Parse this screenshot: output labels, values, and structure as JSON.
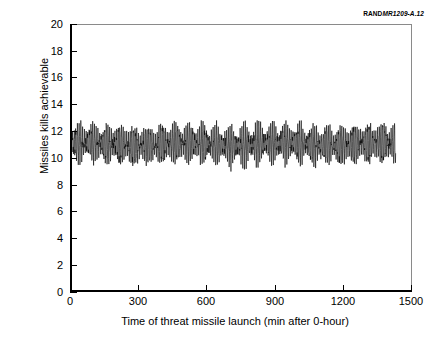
{
  "figure": {
    "corner_id_brand": "RAND",
    "corner_id_doc": "MR1209-A.12"
  },
  "chart_data": {
    "type": "line",
    "title": "",
    "xlabel": "Time of threat missile launch (min after 0-hour)",
    "ylabel": "Missiles kills achievable",
    "xlim": [
      0,
      1500
    ],
    "ylim": [
      0,
      20
    ],
    "xticks": [
      0,
      300,
      600,
      900,
      1200,
      1500
    ],
    "yticks": [
      0,
      2,
      4,
      6,
      8,
      10,
      12,
      14,
      16,
      18,
      20
    ],
    "grid": false,
    "legend": null,
    "series": [
      {
        "name": "Missile kills achievable",
        "color": "#000000",
        "x_start": 0,
        "x_end": 1432,
        "n_points": 1800,
        "mean_level": 11.0,
        "band_min": 8.7,
        "band_max": 12.8,
        "carrier_period_min": 7.5,
        "carrier_amplitude": 1.45,
        "envelope_period_min": 61,
        "envelope_depth": 0.62,
        "secondary_period_min": 2.6,
        "secondary_amplitude": 0.36,
        "noise_amplitude": 0.22,
        "description": "Dense high-frequency oscillation about a level of roughly 11 missile kills, with a beating amplitude envelope repeating about every 60 minutes across the 0 to about 1430 minute span."
      }
    ]
  }
}
